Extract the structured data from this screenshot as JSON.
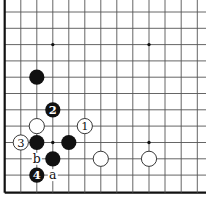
{
  "diagram": {
    "type": "go-board-fragment",
    "grid": {
      "columns": 13,
      "rows": 12,
      "col_x": [
        4.7,
        20.8,
        36.8,
        52.8,
        68.8,
        84.8,
        100.8,
        116.8,
        132.8,
        149,
        165,
        181.2,
        197.3
      ],
      "row_y": [
        12,
        28.3,
        44.6,
        60.9,
        77.2,
        93.5,
        109.8,
        126.1,
        142.5,
        158.8,
        175.1,
        192.7
      ],
      "left_edge": true,
      "bottom_edge": true,
      "line_color": "#555555",
      "edge_color": "#111111",
      "right_extent": 206
    },
    "star_points": [
      {
        "col": 3,
        "row": 2
      },
      {
        "col": 9,
        "row": 2
      },
      {
        "col": 3,
        "row": 8
      },
      {
        "col": 9,
        "row": 8
      }
    ],
    "stones": [
      {
        "color": "black",
        "col": 2,
        "row": 4,
        "label": ""
      },
      {
        "color": "black",
        "col": 3,
        "row": 6,
        "label": "2"
      },
      {
        "color": "white",
        "col": 2,
        "row": 7,
        "label": ""
      },
      {
        "color": "white",
        "col": 5,
        "row": 7,
        "label": "1"
      },
      {
        "color": "white",
        "col": 1,
        "row": 8,
        "label": "3"
      },
      {
        "color": "black",
        "col": 2,
        "row": 8,
        "label": ""
      },
      {
        "color": "black",
        "col": 4,
        "row": 8,
        "label": ""
      },
      {
        "color": "black",
        "col": 3,
        "row": 9,
        "label": ""
      },
      {
        "color": "white",
        "col": 6,
        "row": 9,
        "label": ""
      },
      {
        "color": "white",
        "col": 9,
        "row": 9,
        "label": ""
      },
      {
        "color": "black",
        "col": 2,
        "row": 10,
        "label": "4"
      }
    ],
    "point_labels": [
      {
        "text": "b",
        "col": 2,
        "row": 9
      },
      {
        "text": "a",
        "col": 3,
        "row": 10
      }
    ],
    "colors": {
      "black_stone": "#111111",
      "white_stone": "#ffffff",
      "stone_outline": "#222222",
      "background": "#ffffff"
    }
  }
}
